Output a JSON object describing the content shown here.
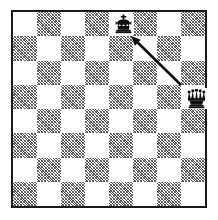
{
  "diagram": {
    "type": "chess-board-diagram",
    "title": "Chess diagram: queen attacking king along a diagonal",
    "board": {
      "files": [
        "a",
        "b",
        "c",
        "d",
        "e",
        "f",
        "g",
        "h"
      ],
      "ranks": [
        "8",
        "7",
        "6",
        "5",
        "4",
        "3",
        "2",
        "1"
      ],
      "size": 8,
      "square_px": 24.5,
      "origin_square_color": "light",
      "light_color": "#ffffff",
      "dark_color": "#8a8a8a",
      "dark_fill_style": "diagonal-hatch",
      "border_color": "#1a1a1a"
    },
    "pieces": [
      {
        "id": "black-king",
        "piece": "king",
        "color": "black",
        "symbol": "♚",
        "square": "e8",
        "file_index": 4,
        "rank_index": 0
      },
      {
        "id": "black-queen",
        "piece": "queen",
        "color": "black",
        "symbol": "♛",
        "square": "h5",
        "file_index": 7,
        "rank_index": 3
      }
    ],
    "arrows": [
      {
        "id": "queen-to-king-arrow",
        "from_square": "h5",
        "to_square": "e8",
        "direction": "up-left",
        "head_at": "to",
        "color": "#101010",
        "x1": 181,
        "y1": 85,
        "x2": 131,
        "y2": 36
      }
    ],
    "piece_colors": {
      "black_piece_fill": "#101010",
      "black_piece_outline": "#000000",
      "piece_backdrop": "#ffffff"
    }
  }
}
